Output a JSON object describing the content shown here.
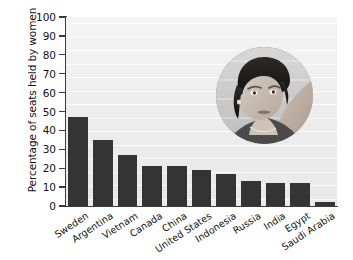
{
  "chart_data": {
    "type": "bar",
    "title": "",
    "subtitle": "",
    "xlabel": "",
    "ylabel": "Percentage of seats held by women",
    "ylim": [
      0,
      100
    ],
    "ytick_labels": [
      "0",
      "10",
      "20",
      "30",
      "40",
      "50",
      "60",
      "70",
      "80",
      "90",
      "100"
    ],
    "ytick_values": [
      0,
      10,
      20,
      30,
      40,
      50,
      60,
      70,
      80,
      90,
      100
    ],
    "grid": false,
    "legend": "none",
    "bar_color": "#343434",
    "plot_background": "#eeeeee",
    "categories": [
      "Sweden",
      "Argentina",
      "Vietnam",
      "Canada",
      "China",
      "United States",
      "Indonesia",
      "Russia",
      "India",
      "Egypt",
      "Saudi Arabia"
    ],
    "values": [
      47,
      35,
      27,
      21,
      21,
      19,
      17,
      13,
      12,
      12,
      2
    ]
  },
  "inset": {
    "name": "portrait-photo",
    "description": "Circular grayscale portrait photograph of a woman looking upward",
    "shape": "circle"
  }
}
